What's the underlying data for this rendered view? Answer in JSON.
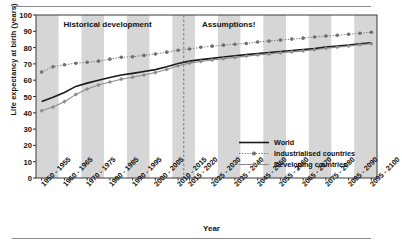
{
  "chart_data": {
    "type": "line",
    "title": "",
    "xlabel": "Year",
    "ylabel": "Life expectancy at birth (years)",
    "ylim": [
      0,
      100
    ],
    "yticks": [
      0,
      10,
      20,
      30,
      40,
      50,
      60,
      70,
      80,
      90,
      100
    ],
    "grid": false,
    "legend_position": "inside-right-middle",
    "annotations": [
      {
        "text": "Historical development",
        "x_frac": 0.21,
        "y_value": 94
      },
      {
        "text": "Assumptions!",
        "x_frac": 0.565,
        "y_value": 94
      }
    ],
    "divider": {
      "label": "projection-start",
      "after_category": "2010 - 2015",
      "style": "dashed"
    },
    "categories": [
      "1950 - 1955",
      "1955 - 1960",
      "1960 - 1965",
      "1965 - 1970",
      "1970 - 1975",
      "1975 - 1980",
      "1980 - 1985",
      "1985 - 1990",
      "1990 - 1995",
      "1995 - 2000",
      "2000 - 2005",
      "2005 - 2010",
      "2010 - 2015",
      "2015 - 2020",
      "2020 - 2025",
      "2025 - 2030",
      "2030 - 2035",
      "2035 - 2040",
      "2040 - 2045",
      "2045 - 2050",
      "2050 - 2055",
      "2055 - 2060",
      "2060 - 2065",
      "2065 - 2070",
      "2070 - 2075",
      "2075 - 2080",
      "2080 - 2085",
      "2085 - 2090",
      "2090 - 2095",
      "2095 - 2100"
    ],
    "tick_labels": [
      "1950 - 1955",
      "1960 - 1965",
      "1970 - 1975",
      "1980 - 1985",
      "1990 - 1995",
      "2000 - 2005",
      "2010 - 2015",
      "2015 - 2020",
      "2025 - 2030",
      "2035 - 2040",
      "2045 - 2050",
      "2055 - 2060",
      "2065 - 2070",
      "2075 - 2080",
      "2085 - 2090",
      "2095 - 2100"
    ],
    "tick_label_indices": [
      0,
      2,
      4,
      6,
      8,
      10,
      12,
      13,
      15,
      17,
      19,
      21,
      23,
      25,
      27,
      29
    ],
    "series": [
      {
        "name": "World",
        "color": "#1a1a1a",
        "style": "solid",
        "marker": "none",
        "values": [
          47.0,
          49.5,
          52.5,
          56.2,
          58.2,
          60.0,
          61.7,
          63.2,
          64.2,
          65.3,
          66.5,
          68.2,
          70.3,
          71.7,
          72.6,
          73.4,
          74.2,
          75.0,
          75.7,
          76.4,
          77.0,
          77.6,
          78.2,
          78.8,
          79.4,
          80.3,
          80.9,
          81.6,
          82.3,
          83.0
        ]
      },
      {
        "name": "Industrialised countries",
        "color": "#6e6e6e",
        "style": "dotted",
        "marker": "circle",
        "values": [
          65.0,
          68.2,
          69.5,
          70.4,
          71.0,
          71.7,
          72.9,
          74.1,
          74.4,
          75.2,
          76.1,
          77.2,
          78.4,
          79.1,
          80.2,
          80.9,
          81.5,
          82.1,
          82.5,
          83.4,
          84.0,
          84.6,
          85.2,
          85.8,
          86.5,
          87.1,
          87.6,
          88.2,
          88.8,
          89.4
        ]
      },
      {
        "name": "Developing countries",
        "color": "#8c8c8c",
        "style": "solid",
        "marker": "diamond",
        "values": [
          41.2,
          43.5,
          46.8,
          51.3,
          54.6,
          57.0,
          58.9,
          60.6,
          61.8,
          63.2,
          64.7,
          66.6,
          68.9,
          70.5,
          71.5,
          72.4,
          73.2,
          74.0,
          74.8,
          75.5,
          76.1,
          76.8,
          77.4,
          78.0,
          78.7,
          79.6,
          80.3,
          81.0,
          81.8,
          82.4
        ]
      }
    ]
  },
  "plot": {
    "band_color": "#d6d6d6",
    "band_color_alt": "#ffffff",
    "frame_color": "#3a3a3a",
    "divider_color": "#7a7a7a"
  }
}
